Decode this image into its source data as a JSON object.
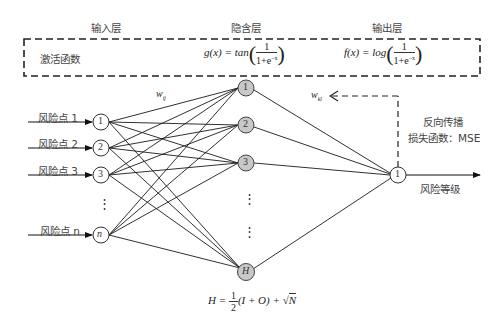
{
  "layers": {
    "input_title": "输入层",
    "hidden_title": "隐含层",
    "output_title": "输出层"
  },
  "activation": {
    "label": "激活函数",
    "hidden_func_lhs": "g(x) = tan",
    "output_func_lhs": "f(x) = log",
    "frac_num": "1",
    "frac_den": "1+e",
    "frac_exp": "−x"
  },
  "input_nodes": [
    {
      "label": "1",
      "input_label": "风险点 1"
    },
    {
      "label": "2",
      "input_label": "风险点 2"
    },
    {
      "label": "3",
      "input_label": "风险点 3"
    },
    {
      "label": "n",
      "input_label": "风险点 n"
    }
  ],
  "hidden_nodes": [
    {
      "label": "1"
    },
    {
      "label": "2"
    },
    {
      "label": "3"
    },
    {
      "label": "H"
    }
  ],
  "output_node": {
    "label": "1",
    "output_label": "风险等级"
  },
  "weights": {
    "input_hidden": "w",
    "input_hidden_sub": "ij",
    "hidden_output": "w",
    "hidden_output_sub": "kl"
  },
  "backprop": {
    "line1": "反向传播",
    "line2": "损失函数：MSE"
  },
  "hidden_formula": {
    "lhs": "H =",
    "num": "1",
    "den": "2",
    "rhs": "(I + O) + ",
    "sqrt_arg": "N"
  },
  "ellipsis": "⋮",
  "colors": {
    "hidden_fill": "#c8c8c8",
    "line": "#1a1a1a",
    "node_stroke": "#333333"
  }
}
